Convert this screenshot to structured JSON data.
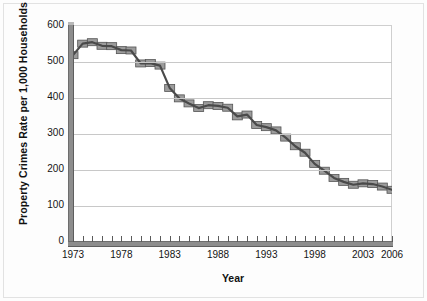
{
  "chart_data": {
    "type": "line",
    "title": "",
    "xlabel": "Year",
    "ylabel": "Property Crimes Rate per 1,000 Households",
    "xlim": [
      1973,
      2006
    ],
    "ylim": [
      0,
      600
    ],
    "y_ticks": [
      0,
      100,
      200,
      300,
      400,
      500,
      600
    ],
    "x_tick_labels": [
      "1973",
      "1978",
      "1983",
      "1988",
      "1993",
      "1998",
      "2003",
      "2006"
    ],
    "x_tick_label_years": [
      1973,
      1978,
      1983,
      1988,
      1993,
      1998,
      2003,
      2006
    ],
    "grid": "horizontal",
    "legend": "none",
    "marker": "square",
    "series": [
      {
        "name": "Property Crimes Rate per 1,000 Households",
        "x": [
          1973,
          1974,
          1975,
          1976,
          1977,
          1978,
          1979,
          1980,
          1981,
          1982,
          1983,
          1984,
          1985,
          1986,
          1987,
          1988,
          1989,
          1990,
          1991,
          1992,
          1993,
          1994,
          1995,
          1996,
          1997,
          1998,
          1999,
          2000,
          2001,
          2002,
          2003,
          2004,
          2005,
          2006
        ],
        "values": [
          519,
          551,
          555,
          545,
          544,
          533,
          532,
          496,
          497,
          490,
          428,
          399,
          385,
          372,
          380,
          378,
          373,
          349,
          354,
          325,
          319,
          310,
          290,
          266,
          248,
          217,
          198,
          178,
          167,
          159,
          163,
          161,
          154,
          145
        ]
      }
    ],
    "colors": {
      "line": "#4a4a4a",
      "marker_fill": "#9c9c9c",
      "marker_stroke": "#545454",
      "grid": "#c8c8c8",
      "axis": "#8d8d8d",
      "text": "#141414",
      "plot_background": "#ffffff",
      "figure_background": "#fdfdfd"
    }
  }
}
